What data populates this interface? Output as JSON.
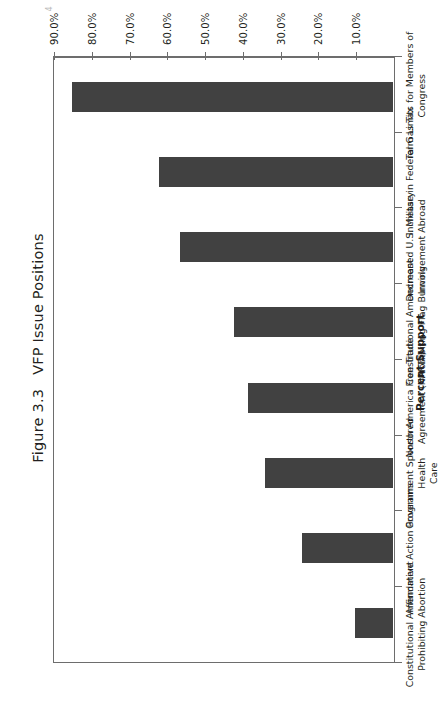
{
  "page": {
    "scan_artifact": "4"
  },
  "figure": {
    "number": "Figure 3.3",
    "title": "VFP Issue Positions"
  },
  "chart_data": {
    "type": "bar",
    "orientation": "vertical",
    "rotation_on_page_degrees": -90,
    "xlabel": "",
    "ylabel": "Percent Support",
    "ylim": [
      0,
      90
    ],
    "ytick_step": 10,
    "grid": false,
    "legend": false,
    "bar_color": "#414141",
    "axis_color": "#6d6d6d",
    "categories": [
      "Constitutional Amendment Prohibiting Abortion",
      "Affirmative Action Programs",
      "Government Sponsored Health Care",
      "North America Free Trade Agreement (NAFTA)",
      "Constitutional Amendment Prohibiting Flag Burning",
      "Decreased U.S. Military Involvement Abroad",
      "Increase in Federal Gas Tax",
      "Term Limits for Members of Congress"
    ],
    "category_labels_wrapped": [
      "Constitutional Amendment\nProhibiting Abortion",
      "Affirmative Action Programs",
      "Government Sponsored Health\nCare",
      "North America Free Trade\nAgreement (NAFTA)",
      "Constitutional Amendment\nProhibiting Flag Burning",
      "Decreased U.S. Military\nInvolvement Abroad",
      "Increase in Federal Gas Tax",
      "Term Limits for Members of\nCongress"
    ],
    "values": [
      10.0,
      24.0,
      34.0,
      38.5,
      42.0,
      56.5,
      62.0,
      85.0
    ],
    "ytick_labels": [
      "10.0%",
      "20.0%",
      "30.0%",
      "40.0%",
      "50.0%",
      "60.0%",
      "70.0%",
      "80.0%",
      "90.0%"
    ],
    "ytick_values": [
      10,
      20,
      30,
      40,
      50,
      60,
      70,
      80,
      90
    ]
  }
}
